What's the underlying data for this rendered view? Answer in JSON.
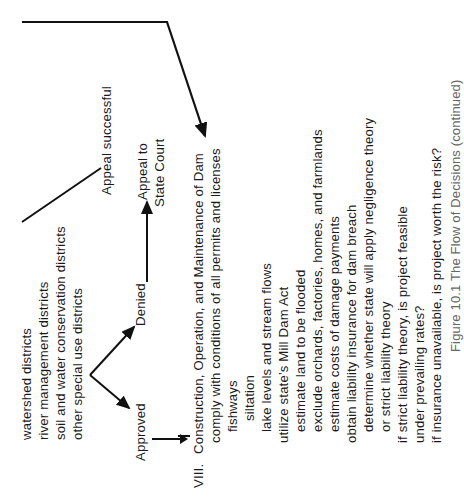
{
  "flowchart": {
    "appeal_successful": "Appeal successful",
    "appeal_to_state_court": [
      "Appeal to",
      "State Court"
    ],
    "districts": [
      "watershed districts",
      "river management districts",
      "soil and water conservation districts",
      "other special use districts"
    ],
    "approved": "Approved",
    "denied": "Denied"
  },
  "section_viii": {
    "numeral": "VIII.",
    "title": "Construction, Operation, and Maintenance of Dam",
    "items": [
      {
        "text": "comply with conditions of all permits and licenses",
        "indent": 1
      },
      {
        "text": "fishways",
        "indent": 2
      },
      {
        "text": "siltation",
        "indent": 3
      },
      {
        "text": "lake levels and stream flows",
        "indent": 2
      },
      {
        "text": "utilize state’s Mill Dam Act",
        "indent": 1
      },
      {
        "text": "estimate land to be flooded",
        "indent": 2
      },
      {
        "text": "exclude orchards, factories, homes, and farmlands",
        "indent": 2
      },
      {
        "text": "estimate costs of damage payments",
        "indent": 2
      },
      {
        "text": "obtain liability insurance for dam breach",
        "indent": 1
      },
      {
        "text": "determine whether state will apply negligence theory",
        "indent": 2
      },
      {
        "text": "or strict liability theory",
        "indent": 2
      },
      {
        "text": "if strict liability theory, is project feasible",
        "indent": 1
      },
      {
        "text": "under prevailing rates?",
        "indent": 1
      },
      {
        "text": "if insurance unavailable, is project worth the risk?",
        "indent": 1
      }
    ]
  },
  "caption": "Figure 10.1 The Flow of Decisions (continued)"
}
